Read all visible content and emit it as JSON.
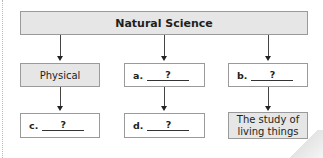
{
  "diagram": {
    "root": {
      "label": "Natural Science"
    },
    "branches": [
      {
        "level1": {
          "label": "Physical",
          "filled": true
        },
        "level2": {
          "letter": "c.",
          "answer": "?",
          "filled": false
        }
      },
      {
        "level1": {
          "letter": "a.",
          "answer": "?",
          "filled": false
        },
        "level2": {
          "letter": "d.",
          "answer": "?",
          "filled": false
        }
      },
      {
        "level1": {
          "letter": "b.",
          "answer": "?",
          "filled": false
        },
        "level2": {
          "label_line1": "The study of",
          "label_line2": "living things",
          "filled": true
        }
      }
    ],
    "colors": {
      "filled_box": "#e6e6e6",
      "border": "#9a9a9a",
      "text": "#231f20"
    }
  }
}
